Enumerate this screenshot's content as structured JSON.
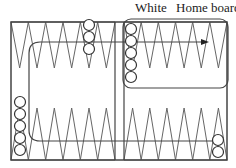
{
  "labels": {
    "white": "White",
    "home_board": "Home board"
  },
  "board": {
    "outer": {
      "x": 11,
      "y": 22,
      "w": 216,
      "h": 138
    },
    "bar": {
      "x1": 115,
      "x2": 124
    },
    "points_per_quadrant": 6,
    "top_tip_y": 68,
    "bottom_tip_y": 108,
    "home_board_box": {
      "x": 123,
      "y": 19,
      "w": 105,
      "h": 69,
      "r": 8
    }
  },
  "checkers": [
    {
      "name": "top-left-stack",
      "cx": 89,
      "ys": [
        25,
        37,
        49
      ]
    },
    {
      "name": "home-board-stack",
      "cx": 131,
      "ys": [
        29,
        41,
        53,
        65,
        77
      ]
    },
    {
      "name": "bottom-left-stack",
      "cx": 20,
      "ys": [
        102,
        114,
        126,
        138,
        150
      ]
    },
    {
      "name": "bottom-right-stack",
      "cx": 218,
      "ys": [
        140,
        152
      ]
    }
  ],
  "arrow_path": "M 218 141 L 40 141 Q 29 141 29 130 L 29 53 Q 29 42 40 42 L 205 42",
  "colors": {
    "line": "#444444",
    "triangle": "#666666",
    "checker_fill": "#ffffff"
  }
}
